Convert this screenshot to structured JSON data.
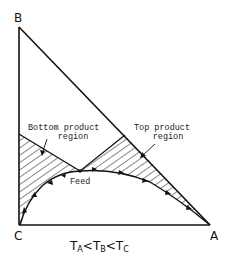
{
  "diagram": {
    "type": "ternary residue curve / distillation region diagram",
    "vertices": {
      "top": "B",
      "bottom_left": "C",
      "bottom_right": "A"
    },
    "labels": {
      "bottom_region_line1": "Bottom product",
      "bottom_region_line2": "region",
      "top_region_line1": "Top product",
      "top_region_line2": "region",
      "feed": "Feed"
    },
    "temperature_order": {
      "t1": "T",
      "t1_sub": "A",
      "t2": "T",
      "t2_sub": "B",
      "t3": "T",
      "t3_sub": "C",
      "sep": "<"
    },
    "colors": {
      "line": "#111111",
      "background": "#ffffff"
    }
  }
}
